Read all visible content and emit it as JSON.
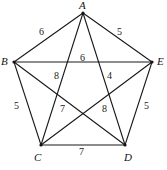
{
  "figure": {
    "name": "complete-graph-k5-pentagon",
    "background_color": "#ffffff",
    "edge_color": "#1a1a1a",
    "label_color": "#141414"
  },
  "vertices": [
    {
      "id": "A",
      "label": "A",
      "x": 83,
      "y": 13,
      "label_x": 79,
      "label_y": 0
    },
    {
      "id": "B",
      "label": "B",
      "x": 14,
      "y": 62,
      "label_x": 1,
      "label_y": 56
    },
    {
      "id": "E",
      "label": "E",
      "x": 152,
      "y": 62,
      "label_x": 157,
      "label_y": 56
    },
    {
      "id": "C",
      "label": "C",
      "x": 41,
      "y": 145,
      "label_x": 34,
      "label_y": 152
    },
    {
      "id": "D",
      "label": "D",
      "x": 125,
      "y": 145,
      "label_x": 124,
      "label_y": 152
    }
  ],
  "edges": [
    {
      "from": "A",
      "to": "B",
      "weight": "6",
      "label_x": 39,
      "label_y": 27
    },
    {
      "from": "A",
      "to": "E",
      "weight": "5",
      "label_x": 117,
      "label_y": 27
    },
    {
      "from": "B",
      "to": "E",
      "weight": "6",
      "label_x": 80,
      "label_y": 53
    },
    {
      "from": "B",
      "to": "C",
      "weight": "5",
      "label_x": 14,
      "label_y": 101
    },
    {
      "from": "D",
      "to": "E",
      "weight": "5",
      "label_x": 144,
      "label_y": 101
    },
    {
      "from": "C",
      "to": "D",
      "weight": "7",
      "label_x": 79,
      "label_y": 147
    },
    {
      "from": "A",
      "to": "C",
      "weight": "8",
      "label_x": 54,
      "label_y": 71
    },
    {
      "from": "A",
      "to": "D",
      "weight": "4",
      "label_x": 107,
      "label_y": 71
    },
    {
      "from": "C",
      "to": "E",
      "weight": "7",
      "label_x": 60,
      "label_y": 104
    },
    {
      "from": "B",
      "to": "D",
      "weight": "8",
      "label_x": 102,
      "label_y": 104
    }
  ],
  "chart_data": {
    "type": "diagram",
    "title": "",
    "nodes": [
      "A",
      "B",
      "C",
      "D",
      "E"
    ],
    "weighted_edges": [
      {
        "edge": "AB",
        "weight": 6
      },
      {
        "edge": "AE",
        "weight": 5
      },
      {
        "edge": "BE",
        "weight": 6
      },
      {
        "edge": "BC",
        "weight": 5
      },
      {
        "edge": "DE",
        "weight": 5
      },
      {
        "edge": "CD",
        "weight": 7
      },
      {
        "edge": "AC",
        "weight": 8
      },
      {
        "edge": "AD",
        "weight": 4
      },
      {
        "edge": "CE",
        "weight": 7
      },
      {
        "edge": "BD",
        "weight": 8
      }
    ]
  }
}
